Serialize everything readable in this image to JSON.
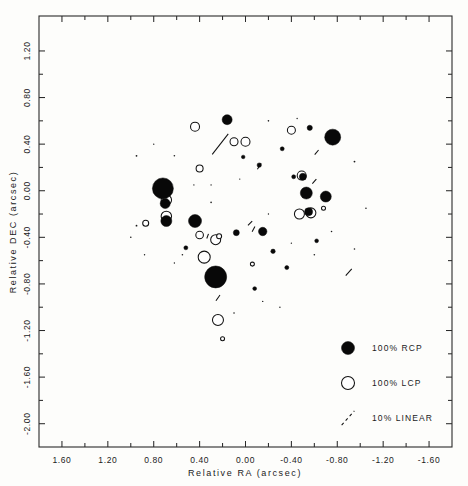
{
  "figure": {
    "kind": "polarization-map",
    "background": "#fdfdfb",
    "ink": "#111111"
  },
  "axes": {
    "x": {
      "title": "Relative RA (arcsec)",
      "ticks": [
        "1.60",
        "1.20",
        "0.80",
        "0.40",
        "0.00",
        "-0.40",
        "-0.80",
        "-1.20",
        "-1.60"
      ],
      "range": [
        1.8,
        -1.8
      ],
      "reversed": true
    },
    "y": {
      "title": "Relative DEC (arcsec)",
      "ticks": [
        "1.20",
        "0.80",
        "0.40",
        "0.00",
        "-0.40",
        "-0.80",
        "-1.20",
        "-1.60",
        "-2.00"
      ],
      "range": [
        -2.2,
        1.5
      ]
    }
  },
  "legend": {
    "items": [
      {
        "label": "100% RCP",
        "symbol": "filled-circle",
        "size": 13
      },
      {
        "label": "100% LCP",
        "symbol": "open-circle",
        "size": 13
      },
      {
        "label": "10% LINEAR",
        "symbol": "dashed-vector",
        "size": 13
      }
    ]
  },
  "chart_data": {
    "type": "scatter",
    "title": "",
    "xlabel": "Relative RA (arcsec)",
    "ylabel": "Relative DEC (arcsec)",
    "xlim": [
      1.8,
      -1.8
    ],
    "ylim": [
      -2.2,
      1.5
    ],
    "grid": false,
    "legend_position": "bottom-right",
    "series": [
      {
        "name": "100% RCP",
        "marker": "filled-circle",
        "points": [
          {
            "x": 0.16,
            "y": 0.61,
            "r": 5.0
          },
          {
            "x": -0.56,
            "y": 0.54,
            "r": 2.6
          },
          {
            "x": -0.76,
            "y": 0.46,
            "r": 8.0
          },
          {
            "x": 0.72,
            "y": 0.02,
            "r": 10.5
          },
          {
            "x": 0.7,
            "y": -0.11,
            "r": 5.0
          },
          {
            "x": 0.69,
            "y": -0.26,
            "r": 5.5
          },
          {
            "x": 0.44,
            "y": -0.26,
            "r": 6.5
          },
          {
            "x": -0.5,
            "y": 0.12,
            "r": 3.5
          },
          {
            "x": -0.53,
            "y": -0.02,
            "r": 6.0
          },
          {
            "x": -0.7,
            "y": -0.05,
            "r": 5.5
          },
          {
            "x": -0.55,
            "y": -0.18,
            "r": 4.0
          },
          {
            "x": -0.15,
            "y": -0.35,
            "r": 4.2
          },
          {
            "x": 0.08,
            "y": -0.36,
            "r": 3.0
          },
          {
            "x": 0.26,
            "y": -0.74,
            "r": 11.0
          },
          {
            "x": -0.12,
            "y": 0.22,
            "r": 2.2
          },
          {
            "x": -0.32,
            "y": 0.36,
            "r": 2.0
          },
          {
            "x": -0.42,
            "y": 0.12,
            "r": 2.0
          },
          {
            "x": -0.24,
            "y": -0.52,
            "r": 2.2
          },
          {
            "x": -0.36,
            "y": -0.66,
            "r": 2.0
          },
          {
            "x": 0.02,
            "y": 0.29,
            "r": 1.8
          },
          {
            "x": 0.52,
            "y": -0.49,
            "r": 2.0
          },
          {
            "x": -0.62,
            "y": -0.43,
            "r": 1.9
          },
          {
            "x": -0.08,
            "y": -0.84,
            "r": 1.9
          }
        ]
      },
      {
        "name": "100% LCP",
        "marker": "open-circle",
        "points": [
          {
            "x": 0.44,
            "y": 0.55,
            "r": 4.5
          },
          {
            "x": -0.4,
            "y": 0.52,
            "r": 4.0
          },
          {
            "x": 0.1,
            "y": 0.42,
            "r": 4.0
          },
          {
            "x": 0.0,
            "y": 0.42,
            "r": 4.5
          },
          {
            "x": 0.4,
            "y": 0.19,
            "r": 3.5
          },
          {
            "x": 0.69,
            "y": -0.08,
            "r": 5.2
          },
          {
            "x": 0.69,
            "y": -0.22,
            "r": 5.2
          },
          {
            "x": 0.87,
            "y": -0.28,
            "r": 3.0
          },
          {
            "x": -0.49,
            "y": 0.13,
            "r": 4.5
          },
          {
            "x": -0.57,
            "y": -0.19,
            "r": 5.0
          },
          {
            "x": -0.47,
            "y": -0.2,
            "r": 5.0
          },
          {
            "x": 0.26,
            "y": -0.42,
            "r": 5.0
          },
          {
            "x": 0.23,
            "y": -0.39,
            "r": 2.5
          },
          {
            "x": 0.4,
            "y": -0.38,
            "r": 3.8
          },
          {
            "x": 0.36,
            "y": -0.57,
            "r": 6.0
          },
          {
            "x": 0.24,
            "y": -1.11,
            "r": 5.5
          },
          {
            "x": -0.68,
            "y": -0.15,
            "r": 2.0
          },
          {
            "x": -0.06,
            "y": -0.63,
            "r": 2.0
          },
          {
            "x": 0.2,
            "y": -1.27,
            "r": 2.0
          }
        ]
      },
      {
        "name": "10% LINEAR",
        "marker": "vector",
        "vectors": [
          {
            "x": 0.22,
            "y": 0.4,
            "angle": 52,
            "length": 26
          },
          {
            "x": -0.12,
            "y": 0.21,
            "angle": 58,
            "length": 7
          },
          {
            "x": -0.04,
            "y": -0.28,
            "angle": 45,
            "length": 6
          },
          {
            "x": -0.07,
            "y": -0.33,
            "angle": 62,
            "length": 6
          },
          {
            "x": -0.62,
            "y": 0.33,
            "angle": 50,
            "length": 6
          },
          {
            "x": -0.6,
            "y": 0.08,
            "angle": 48,
            "length": 6
          },
          {
            "x": 0.33,
            "y": -0.39,
            "angle": 70,
            "length": 5
          },
          {
            "x": -0.9,
            "y": -0.7,
            "angle": 48,
            "length": 9
          },
          {
            "x": 0.24,
            "y": -0.92,
            "angle": 55,
            "length": 7
          }
        ]
      }
    ]
  }
}
